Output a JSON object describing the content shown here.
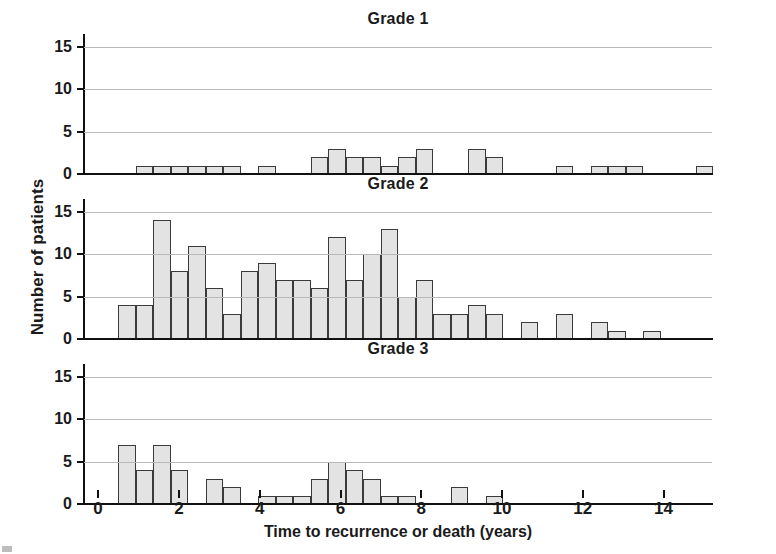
{
  "figure": {
    "ylabel": "Number of patients",
    "xlabel": "Time to recurrence or death (years)",
    "bar_fill": "#e3e3e3",
    "bar_stroke": "#3a3a3a",
    "grid_color": "#b9b9b9"
  },
  "axis": {
    "y_ticks": [
      0,
      5,
      10,
      15
    ],
    "y_tick_labels": [
      "0",
      "5",
      "10",
      "15"
    ],
    "x_ticks": [
      0,
      2,
      4,
      6,
      8,
      10,
      12,
      14
    ],
    "x_tick_labels": [
      "0",
      "2",
      "4",
      "6",
      "8",
      "10",
      "12",
      "14"
    ],
    "xlim": [
      -0.35,
      15.2
    ],
    "ylim": [
      0,
      16.5
    ]
  },
  "panels": [
    {
      "id": "grade-1",
      "title": "Grade 1"
    },
    {
      "id": "grade-2",
      "title": "Grade 2"
    },
    {
      "id": "grade-3",
      "title": "Grade 3"
    }
  ],
  "chart_data": [
    {
      "type": "bar",
      "title": "Grade 1",
      "xlabel": "Time to recurrence or death (years)",
      "ylabel": "Number of patients",
      "ylim": [
        0,
        16.5
      ],
      "xlim": [
        -0.35,
        15.2
      ],
      "grid": true,
      "legend": "none",
      "bin_width": 0.4333,
      "bin_starts": [
        0.933,
        1.367,
        1.8,
        2.233,
        2.667,
        3.1,
        3.967,
        5.267,
        5.7,
        6.133,
        6.567,
        7.0,
        7.433,
        7.867,
        8.3,
        9.167,
        9.6,
        11.333,
        12.2,
        12.633,
        13.067,
        14.8
      ],
      "values": [
        1,
        1,
        1,
        1,
        1,
        1,
        1,
        2,
        3,
        2,
        2,
        1,
        2,
        3,
        0,
        3,
        2,
        1,
        1,
        1,
        1,
        1
      ],
      "ytick_labels": [
        "0",
        "5",
        "10",
        "15"
      ]
    },
    {
      "type": "bar",
      "title": "Grade 2",
      "xlabel": "Time to recurrence or death (years)",
      "ylabel": "Number of patients",
      "ylim": [
        0,
        16.5
      ],
      "xlim": [
        -0.35,
        15.2
      ],
      "grid": true,
      "legend": "none",
      "bin_width": 0.4333,
      "bin_starts": [
        0.5,
        0.933,
        1.367,
        1.8,
        2.233,
        2.667,
        3.1,
        3.533,
        3.967,
        4.4,
        4.833,
        5.267,
        5.7,
        6.133,
        6.567,
        7.0,
        7.433,
        7.867,
        8.3,
        8.733,
        9.167,
        9.6,
        10.467,
        11.333,
        12.2,
        12.633,
        13.5
      ],
      "values": [
        4,
        4,
        14,
        8,
        11,
        6,
        3,
        8,
        9,
        7,
        7,
        6,
        12,
        7,
        10,
        13,
        5,
        7,
        3,
        3,
        4,
        3,
        2,
        3,
        2,
        1,
        1
      ],
      "ytick_labels": [
        "0",
        "5",
        "10",
        "15"
      ]
    },
    {
      "type": "bar",
      "title": "Grade 3",
      "xlabel": "Time to recurrence or death (years)",
      "ylabel": "Number of patients",
      "ylim": [
        0,
        16.5
      ],
      "xlim": [
        -0.35,
        15.2
      ],
      "grid": true,
      "legend": "none",
      "bin_width": 0.4333,
      "bin_starts": [
        0.5,
        0.933,
        1.367,
        1.8,
        2.667,
        3.1,
        3.967,
        4.4,
        4.833,
        5.267,
        5.7,
        6.133,
        6.567,
        7.0,
        7.433,
        8.733,
        9.6
      ],
      "values": [
        7,
        4,
        7,
        4,
        3,
        2,
        1,
        1,
        1,
        3,
        5,
        4,
        3,
        1,
        1,
        2,
        1
      ],
      "ytick_labels": [
        "0",
        "5",
        "10",
        "15"
      ]
    }
  ]
}
